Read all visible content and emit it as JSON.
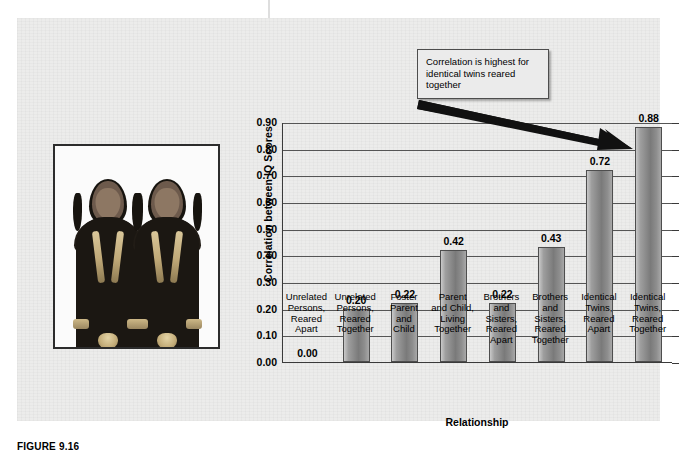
{
  "figure": {
    "caption": "FIGURE 9.16"
  },
  "photo": {
    "alt_name": "identical-twins-photograph",
    "subject": "two identical twin girls in dark embroidered dresses"
  },
  "callout": {
    "text": "Correlation is highest for identical twins reared together",
    "arrow": "arrow-pointing-to-tallest-bar"
  },
  "chart_data": {
    "type": "bar",
    "title": "",
    "xlabel": "Relationship",
    "ylabel": "Correlation between IQ Scores",
    "ylim": [
      0.0,
      0.9
    ],
    "ytick_labels": [
      "0.90",
      "0.80",
      "0.70",
      "0.60",
      "0.50",
      "0.40",
      "0.30",
      "0.20",
      "0.10",
      "0.00"
    ],
    "ytick_values": [
      0.9,
      0.8,
      0.7,
      0.6,
      0.5,
      0.4,
      0.3,
      0.2,
      0.1,
      0.0
    ],
    "grid": true,
    "legend": "none",
    "categories": [
      "Unrelated Persons, Reared Apart",
      "Unrelated Persons, Reared Together",
      "Foster Parent and Child",
      "Parent and Child, Living Together",
      "Brothers and Sisters, Reared Apart",
      "Brothers and Sisters, Reared Together",
      "Identical Twins, Reared Apart",
      "Identical Twins, Reared Together"
    ],
    "category_lines": [
      [
        "Unrelated",
        "Persons,",
        "Reared",
        "Apart"
      ],
      [
        "Unrelated",
        "Persons,",
        "Reared",
        "Together"
      ],
      [
        "Foster",
        "Parent",
        "and",
        "Child"
      ],
      [
        "Parent",
        "and Child,",
        "Living",
        "Together"
      ],
      [
        "Brothers",
        "and",
        "Sisters,",
        "Reared",
        "Apart"
      ],
      [
        "Brothers",
        "and",
        "Sisters,",
        "Reared",
        "Together"
      ],
      [
        "Identical",
        "Twins,",
        "Reared",
        "Apart"
      ],
      [
        "Identical",
        "Twins,",
        "Reared",
        "Together"
      ]
    ],
    "values": [
      0.0,
      0.2,
      0.22,
      0.42,
      0.22,
      0.43,
      0.72,
      0.88
    ],
    "value_labels": [
      "0.00",
      "0.20",
      "0.22",
      "0.42",
      "0.22",
      "0.43",
      "0.72",
      "0.88"
    ],
    "bar_color": "#8a8a8a",
    "bar_edge_color": "#4e4e4e"
  },
  "colors": {
    "panel_background": "#ececeb",
    "page_background": "#ffffff",
    "axis": "#3a3a3a",
    "gridline": "#555555",
    "text": "#000000",
    "callout_background": "#ebebeb",
    "callout_border": "#4d4d4d"
  }
}
